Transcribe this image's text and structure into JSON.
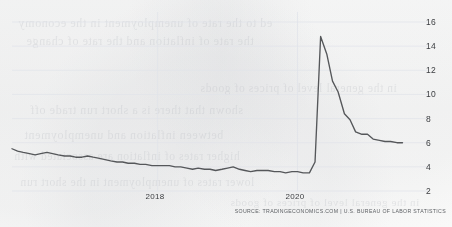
{
  "chart_data": {
    "type": "line",
    "title": "",
    "subtitle": "",
    "xlabel": "",
    "ylabel": "",
    "ylim": [
      2,
      16
    ],
    "xlim": [
      2015.92,
      2021.75
    ],
    "grid": true,
    "legend_position": "none",
    "y_ticks": [
      16,
      14,
      12,
      10,
      8,
      6,
      4,
      2
    ],
    "x_ticks": [
      {
        "label": "2018",
        "value": 2018
      },
      {
        "label": "2020",
        "value": 2020
      }
    ],
    "series": [
      {
        "name": "Unemployment Rate",
        "color": "#55575a",
        "x": [
          2015.92,
          2016.0,
          2016.08,
          2016.17,
          2016.25,
          2016.33,
          2016.42,
          2016.5,
          2016.58,
          2016.67,
          2016.75,
          2016.83,
          2016.92,
          2017.0,
          2017.08,
          2017.17,
          2017.25,
          2017.33,
          2017.42,
          2017.5,
          2017.58,
          2017.67,
          2017.75,
          2017.83,
          2017.92,
          2018.0,
          2018.08,
          2018.17,
          2018.25,
          2018.33,
          2018.42,
          2018.5,
          2018.58,
          2018.67,
          2018.75,
          2018.83,
          2018.92,
          2019.0,
          2019.08,
          2019.17,
          2019.25,
          2019.33,
          2019.42,
          2019.5,
          2019.58,
          2019.67,
          2019.75,
          2019.83,
          2019.92,
          2020.0,
          2020.08,
          2020.17,
          2020.25,
          2020.33,
          2020.42,
          2020.5,
          2020.58,
          2020.67,
          2020.75,
          2020.83,
          2020.92,
          2021.0,
          2021.08,
          2021.17,
          2021.25,
          2021.33,
          2021.42,
          2021.5
        ],
        "values": [
          5.5,
          5.3,
          5.2,
          5.1,
          5.0,
          5.1,
          5.2,
          5.1,
          5.0,
          4.9,
          4.9,
          4.8,
          4.8,
          4.9,
          4.8,
          4.7,
          4.6,
          4.5,
          4.4,
          4.4,
          4.3,
          4.3,
          4.2,
          4.2,
          4.1,
          4.1,
          4.1,
          4.1,
          4.0,
          4.0,
          3.9,
          3.8,
          3.9,
          3.8,
          3.8,
          3.7,
          3.8,
          3.9,
          4.0,
          3.8,
          3.7,
          3.6,
          3.7,
          3.7,
          3.7,
          3.6,
          3.6,
          3.5,
          3.6,
          3.6,
          3.5,
          3.5,
          4.4,
          14.8,
          13.3,
          11.1,
          10.2,
          8.4,
          7.9,
          6.9,
          6.7,
          6.7,
          6.3,
          6.2,
          6.1,
          6.1,
          6.0,
          6.0
        ]
      }
    ],
    "notable_points": {
      "series_start": 5.5,
      "pre_pandemic_low": 3.5,
      "pandemic_peak": 14.8,
      "series_end": 6.0
    }
  },
  "axis": {
    "y_labels": [
      "16",
      "14",
      "12",
      "10",
      "8",
      "6",
      "4",
      "2"
    ],
    "x_labels": [
      "2018",
      "2020"
    ]
  },
  "footer": {
    "source": "SOURCE: TRADINGECONOMICS.COM | U.S. BUREAU OF LABOR STATISTICS"
  },
  "ghost_text": {
    "lines": [
      "ed to the rate of unemployment in the economy",
      "the rate of inflation and the rate of change",
      "in the general level of prices of goods",
      "shown that there is a short run trade off",
      "between inflation and unemployment",
      "higher rates of inflation are associated with",
      "lower rates of unemployment in the short run"
    ]
  },
  "style": {
    "line_color": "#55575a",
    "grid_color": "#dfe3ea",
    "tick_text_color": "#3b3d40",
    "source_text_color": "#5d6064",
    "background": "#fbfbfa"
  }
}
